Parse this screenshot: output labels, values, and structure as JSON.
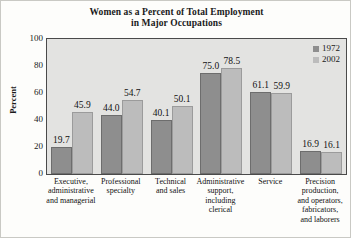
{
  "chart_data": {
    "type": "bar",
    "title": "Women as a Percent of Total Employment in Major Occupations",
    "title_line1": "Women as a Percent of Total Employment",
    "title_line2": "in Major Occupations",
    "xlabel": "",
    "ylabel": "Percent",
    "ylim": [
      0,
      100
    ],
    "yticks": [
      100,
      80,
      60,
      40,
      20,
      0
    ],
    "grid": false,
    "legend_position": "top-right",
    "categories": [
      "Executive, administrative and managerial",
      "Professional specialty",
      "Technical and sales",
      "Administrative support, including clerical",
      "Service",
      "Precision production, and operators, fabricators, and laborers"
    ],
    "category_lines": [
      [
        "Executive,",
        "administrative",
        "and managerial"
      ],
      [
        "Professional",
        "specialty"
      ],
      [
        "Technical",
        "and sales"
      ],
      [
        "Administrative",
        "support,",
        "including",
        "clerical"
      ],
      [
        "Service"
      ],
      [
        "Precision",
        "production,",
        "and operators,",
        "fabricators,",
        "and laborers"
      ]
    ],
    "series": [
      {
        "name": "1972",
        "color": "#8e8e8e",
        "values": [
          19.7,
          44.0,
          40.1,
          75.0,
          61.1,
          16.9
        ],
        "labels": [
          "19.7",
          "44.0",
          "40.1",
          "75.0",
          "61.1",
          "16.9"
        ]
      },
      {
        "name": "2002",
        "color": "#bcbcbc",
        "values": [
          45.9,
          54.7,
          50.1,
          78.5,
          59.9,
          16.1
        ],
        "labels": [
          "45.9",
          "54.7",
          "50.1",
          "78.5",
          "59.9",
          "16.1"
        ]
      }
    ]
  },
  "colors": {
    "plot_background": "#e3e3e1",
    "page_background": "#fdfdfb",
    "axis": "#4a4a4a",
    "series_1972": "#8e8e8e",
    "series_2002": "#bcbcbc"
  }
}
